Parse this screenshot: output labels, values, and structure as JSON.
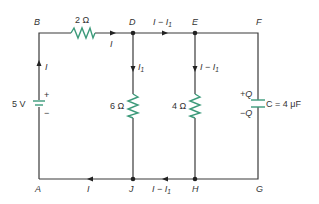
{
  "diagram": {
    "type": "circuit",
    "nodes": {
      "A": "A",
      "B": "B",
      "D": "D",
      "E": "E",
      "F": "F",
      "G": "G",
      "H": "H",
      "J": "J"
    },
    "components": {
      "battery": {
        "label": "5 V",
        "plus": "+",
        "minus": "−"
      },
      "r_top": {
        "label": "2 Ω"
      },
      "r_left": {
        "label": "6 Ω"
      },
      "r_right": {
        "label": "4 Ω"
      },
      "capacitor": {
        "label": "C = 4 μF",
        "plus_charge": "+Q",
        "minus_charge": "−Q"
      }
    },
    "currents": {
      "left_wire": "I",
      "top_after_resistor": "I",
      "top_DE": "I − I",
      "top_DE_sub": "1",
      "branch_D": "I",
      "branch_D_sub": "1",
      "branch_E": "I − I",
      "branch_E_sub": "1",
      "bottom_HJ": "I − I",
      "bottom_HJ_sub": "1",
      "bottom_JA": "I"
    },
    "colors": {
      "wire": "#3a3a3a",
      "component": "#3c9a7a",
      "text": "#333333"
    }
  }
}
